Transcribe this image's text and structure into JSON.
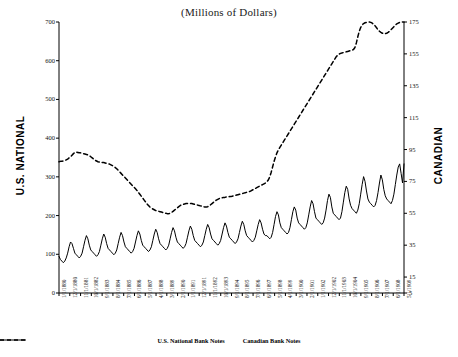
{
  "title": "(Millions of Dollars)",
  "axes": {
    "left_title": "U.S. NATIONAL",
    "right_title": "CANADIAN",
    "left_ticks": [
      "0",
      "100",
      "200",
      "300",
      "400",
      "500",
      "600",
      "700"
    ],
    "right_ticks": [
      "5",
      "15",
      "35",
      "55",
      "75",
      "95",
      "115",
      "135",
      "155",
      "175"
    ]
  },
  "legend": {
    "items": [
      {
        "label": "U.S. National Bank Notes",
        "style": "dashed"
      },
      {
        "label": "Canadian Bank Notes",
        "style": "solid"
      }
    ]
  },
  "colors": {
    "ink": "#000000",
    "background": "#ffffff"
  },
  "chart_data": {
    "type": "line",
    "title": "(Millions of Dollars)",
    "xlabel": "",
    "ylabel": "U.S. NATIONAL",
    "y2label": "CANADIAN",
    "ylim": [
      0,
      700
    ],
    "y2lim": [
      5,
      175
    ],
    "grid": false,
    "legend_position": "bottom",
    "x_tick_labels": [
      "1/1/1880",
      "12/1/1880",
      "11/1/1881",
      "10/1/1882",
      "9/1/1883",
      "8/1/1884",
      "7/1/1885",
      "6/1/1886",
      "5/1/1887",
      "4/1/1888",
      "3/1/1889",
      "2/1/1890",
      "1/1/1891",
      "12/1/1891",
      "11/1/1892",
      "10/1/1893",
      "9/1/1894",
      "8/1/1895",
      "7/1/1896",
      "6/1/1897",
      "5/1/1898",
      "4/1/1899",
      "3/1/1900",
      "2/1/1901",
      "1/1/1902",
      "12/1/1902",
      "11/1/1903",
      "10/1/1904",
      "9/1/1905",
      "8/1/1906",
      "7/1/1907",
      "6/1/1908",
      "5/1/1909"
    ],
    "series": [
      {
        "name": "U.S. National Bank Notes",
        "axis": "left",
        "style": "dashed",
        "values": [
          339,
          340,
          340,
          341,
          342,
          344,
          346,
          349,
          352,
          356,
          360,
          363,
          364,
          363,
          362,
          362,
          361,
          360,
          359,
          358,
          357,
          355,
          352,
          349,
          346,
          343,
          341,
          339,
          338,
          337,
          337,
          337,
          336,
          335,
          334,
          333,
          331,
          329,
          327,
          324,
          321,
          317,
          313,
          309,
          305,
          301,
          297,
          293,
          289,
          285,
          281,
          277,
          273,
          269,
          265,
          260,
          255,
          250,
          245,
          240,
          235,
          230,
          226,
          222,
          219,
          217,
          215,
          213,
          212,
          211,
          210,
          209,
          208,
          207,
          206,
          205,
          205,
          206,
          208,
          211,
          214,
          217,
          220,
          223,
          226,
          228,
          229,
          230,
          231,
          231,
          231,
          231,
          231,
          230,
          229,
          228,
          227,
          226,
          225,
          224,
          223,
          222,
          222,
          223,
          225,
          228,
          231,
          234,
          237,
          240,
          242,
          244,
          245,
          246,
          247,
          247,
          248,
          248,
          249,
          249,
          250,
          251,
          252,
          253,
          254,
          255,
          256,
          257,
          258,
          259,
          260,
          261,
          262,
          264,
          266,
          268,
          270,
          272,
          274,
          276,
          278,
          280,
          282,
          284,
          287,
          292,
          300,
          312,
          326,
          340,
          352,
          362,
          370,
          376,
          382,
          388,
          394,
          400,
          406,
          412,
          418,
          424,
          430,
          436,
          442,
          448,
          454,
          460,
          466,
          472,
          478,
          484,
          490,
          496,
          502,
          508,
          514,
          520,
          526,
          532,
          538,
          544,
          550,
          556,
          562,
          568,
          574,
          580,
          586,
          592,
          598,
          604,
          610,
          614,
          617,
          619,
          620,
          621,
          622,
          623,
          624,
          625,
          626,
          627,
          629,
          634,
          646,
          662,
          676,
          686,
          692,
          696,
          698,
          699,
          700,
          700,
          699,
          697,
          694,
          690,
          685,
          680,
          676,
          673,
          671,
          670,
          670,
          671,
          673,
          676,
          680,
          684,
          688,
          692,
          695,
          697,
          699,
          700,
          700,
          700
        ]
      },
      {
        "name": "Canadian Bank Notes",
        "axis": "right",
        "style": "solid",
        "values": [
          28,
          26,
          25,
          24,
          25,
          27,
          30,
          34,
          37,
          36,
          33,
          30,
          29,
          28,
          27,
          28,
          30,
          34,
          38,
          41,
          39,
          35,
          32,
          31,
          30,
          29,
          28,
          29,
          31,
          35,
          39,
          42,
          40,
          36,
          33,
          32,
          31,
          30,
          29,
          30,
          32,
          36,
          40,
          43,
          41,
          37,
          34,
          33,
          32,
          31,
          30,
          31,
          33,
          37,
          41,
          44,
          42,
          38,
          35,
          34,
          33,
          32,
          31,
          32,
          34,
          38,
          42,
          45,
          43,
          39,
          36,
          35,
          34,
          33,
          32,
          33,
          35,
          39,
          43,
          46,
          44,
          40,
          37,
          36,
          35,
          34,
          33,
          34,
          36,
          40,
          44,
          47,
          45,
          41,
          38,
          37,
          36,
          35,
          34,
          35,
          37,
          41,
          45,
          48,
          46,
          42,
          39,
          38,
          37,
          36,
          35,
          36,
          38,
          42,
          46,
          49,
          47,
          43,
          40,
          39,
          38,
          37,
          36,
          37,
          39,
          43,
          47,
          50,
          48,
          44,
          41,
          40,
          39,
          38,
          37,
          38,
          40,
          44,
          48,
          51,
          49,
          45,
          42,
          41,
          41,
          40,
          39,
          40,
          43,
          48,
          53,
          56,
          54,
          49,
          46,
          45,
          44,
          43,
          42,
          43,
          46,
          51,
          56,
          59,
          57,
          52,
          49,
          48,
          47,
          46,
          45,
          46,
          49,
          54,
          59,
          63,
          61,
          56,
          52,
          51,
          50,
          49,
          48,
          49,
          52,
          57,
          63,
          67,
          65,
          59,
          55,
          54,
          53,
          52,
          51,
          52,
          56,
          62,
          68,
          72,
          70,
          64,
          60,
          58,
          57,
          56,
          55,
          57,
          61,
          67,
          73,
          78,
          75,
          69,
          64,
          62,
          61,
          60,
          59,
          60,
          63,
          68,
          74,
          79,
          76,
          70,
          66,
          64,
          63,
          62,
          61,
          63,
          67,
          73,
          79,
          84,
          86,
          80,
          74,
          86
        ]
      }
    ]
  }
}
